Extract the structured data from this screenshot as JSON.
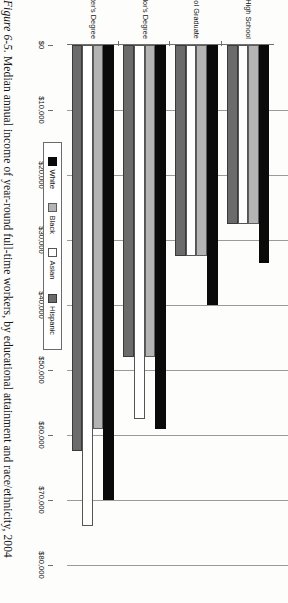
{
  "caption": {
    "figure_number": "Figure 6-5.",
    "text": " Median annual income of year-round full-time workers, by educational attainment and race/ethnicity, 2004"
  },
  "legend": {
    "position": "top-left",
    "items": [
      {
        "label": "White",
        "color": "#0a0a0a",
        "swatch": "white"
      },
      {
        "label": "Black",
        "color": "#b4b4b4",
        "swatch": "black"
      },
      {
        "label": "Asian",
        "color": "#ffffff",
        "swatch": "asian"
      },
      {
        "label": "Hispanic",
        "color": "#6b6b6b",
        "swatch": "hispanic"
      }
    ]
  },
  "axis": {
    "value_ticks": [
      "$0",
      "$10,000",
      "$20,000",
      "$30,000",
      "$40,000",
      "$50,000",
      "$60,000",
      "$70,000",
      "$80,000"
    ],
    "value_tick_numbers": [
      0,
      10000,
      20000,
      30000,
      40000,
      50000,
      60000,
      70000,
      80000
    ]
  },
  "chart_data": {
    "type": "bar",
    "orientation": "horizontal",
    "title": "Median annual income of year-round full-time workers, by educational attainment and race/ethnicity, 2004",
    "xlabel": "",
    "ylabel": "",
    "categories": [
      "Less Than High School",
      "High School Graduate",
      "Bachelor's Degree",
      "Master's Degree"
    ],
    "series": [
      {
        "name": "White",
        "values": [
          33500,
          40000,
          59000,
          70000
        ]
      },
      {
        "name": "Black",
        "values": [
          27500,
          32500,
          48000,
          59000
        ]
      },
      {
        "name": "Asian",
        "values": [
          27500,
          32500,
          57500,
          74000
        ]
      },
      {
        "name": "Hispanic",
        "values": [
          27500,
          32500,
          48000,
          62500
        ]
      }
    ],
    "xlim": [
      0,
      80000
    ],
    "grid": true,
    "legend_position": "top-left"
  }
}
